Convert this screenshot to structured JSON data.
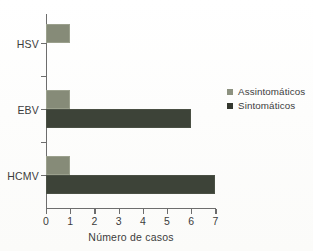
{
  "chart_data": {
    "type": "bar",
    "orientation": "horizontal",
    "title": "",
    "subtitle": "",
    "xlabel": "Número de casos",
    "ylabel": "",
    "categories": [
      "HSV",
      "EBV",
      "HCMV"
    ],
    "series": [
      {
        "name": "Assintomáticos",
        "values": [
          1,
          1,
          1
        ],
        "color": "#868b78"
      },
      {
        "name": "Sintomáticos",
        "values": [
          0,
          6,
          7
        ],
        "color": "#3d4338"
      }
    ],
    "xlim": [
      0,
      7
    ],
    "xticks": [
      "0",
      "1",
      "2",
      "3",
      "4",
      "5",
      "6",
      "7"
    ],
    "xtick_values": [
      0,
      1,
      2,
      3,
      4,
      5,
      6,
      7
    ],
    "grid": false,
    "legend_position": "right"
  },
  "legend": {
    "items": [
      {
        "label": "Assintomáticos",
        "swatch": "light"
      },
      {
        "label": "Sintomáticos",
        "swatch": "dark"
      }
    ]
  },
  "axis": {
    "x_title": "Número de casos",
    "y_categories": [
      "HSV",
      "EBV",
      "HCMV"
    ]
  },
  "colors": {
    "asymptomatic": "#868b78",
    "symptomatic": "#3d4338",
    "axis": "#6d6d6d",
    "text": "#3c3c3c",
    "background": "#fdfdfb"
  }
}
